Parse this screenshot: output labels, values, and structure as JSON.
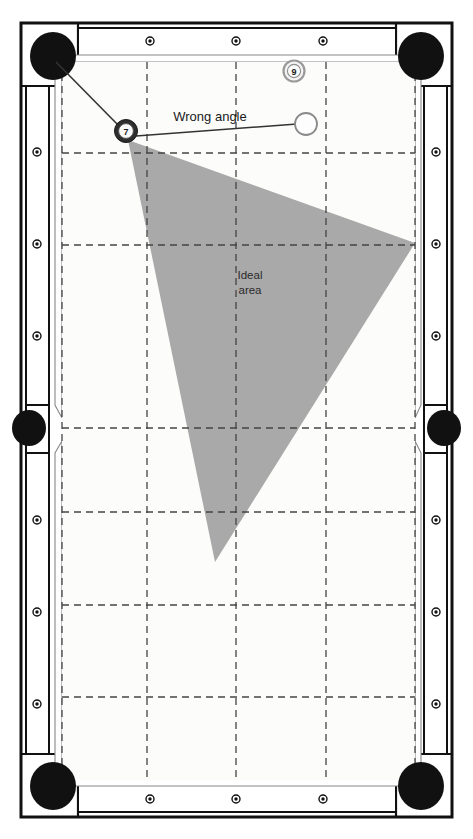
{
  "diagram": {
    "colors": {
      "cloth": "#fcfcfa",
      "rail": "#ffffff",
      "frame_stroke": "#111111",
      "pocket": "#111111",
      "grid_line": "#444444",
      "ideal_area_fill": "#a9a9a9",
      "aim_line": "#333333",
      "ball_outline": "#3a3a3a",
      "cue_ball_fill": "#fdfdfd",
      "object_ball_fill": "#f2f2f2"
    },
    "annotations": [
      {
        "id": "wrong-angle",
        "label": "Wrong angle",
        "x": 210,
        "y": 121
      },
      {
        "id": "ideal-area",
        "label_line1": "Ideal",
        "label_line2": "area",
        "x": 250,
        "y": 279
      }
    ],
    "balls": [
      {
        "id": "object-ball-9",
        "name": "nine-ball",
        "number": "9",
        "cx": 294,
        "cy": 71,
        "r": 10.5,
        "type": "numbered"
      },
      {
        "id": "object-ball-7",
        "name": "seven-ball",
        "number": "7",
        "cx": 126,
        "cy": 131,
        "r": 11.5,
        "type": "numbered"
      },
      {
        "id": "cue-ball",
        "name": "cue-ball",
        "number": "",
        "cx": 306,
        "cy": 124,
        "r": 11.0,
        "type": "cue"
      }
    ],
    "pockets": [
      {
        "id": "pocket-top-left",
        "name": "corner-pocket-top-left",
        "cx": 53,
        "cy": 56,
        "rx": 23,
        "ry": 24
      },
      {
        "id": "pocket-top-right",
        "name": "corner-pocket-top-right",
        "cx": 421,
        "cy": 56,
        "rx": 23,
        "ry": 24
      },
      {
        "id": "pocket-left-side",
        "name": "side-pocket-left",
        "cx": 29,
        "cy": 428,
        "rx": 17,
        "ry": 18
      },
      {
        "id": "pocket-right-side",
        "name": "side-pocket-right",
        "cx": 444,
        "cy": 428,
        "rx": 17,
        "ry": 18
      },
      {
        "id": "pocket-bottom-left",
        "name": "corner-pocket-bottom-left",
        "cx": 53,
        "cy": 786,
        "rx": 23,
        "ry": 24
      },
      {
        "id": "pocket-bottom-right",
        "name": "corner-pocket-bottom-right",
        "cx": 421,
        "cy": 786,
        "rx": 23,
        "ry": 24
      }
    ],
    "diamonds_top": [
      {
        "cx": 150,
        "cy": 38
      },
      {
        "cx": 236,
        "cy": 38
      },
      {
        "cx": 323,
        "cy": 38
      }
    ],
    "diamonds_bottom": [
      {
        "cx": 150,
        "cy": 803
      },
      {
        "cx": 236,
        "cy": 803
      },
      {
        "cx": 323,
        "cy": 803
      }
    ],
    "diamonds_left": [
      {
        "cx": 31,
        "cy": 152
      },
      {
        "cx": 31,
        "cy": 244
      },
      {
        "cx": 31,
        "cy": 336
      },
      {
        "cx": 31,
        "cy": 520
      },
      {
        "cx": 31,
        "cy": 612
      },
      {
        "cx": 31,
        "cy": 704
      }
    ],
    "diamonds_right": [
      {
        "cx": 442,
        "cy": 152
      },
      {
        "cx": 442,
        "cy": 244
      },
      {
        "cx": 442,
        "cy": 336
      },
      {
        "cx": 442,
        "cy": 520
      },
      {
        "cx": 442,
        "cy": 612
      },
      {
        "cx": 442,
        "cy": 704
      }
    ],
    "grid_vertical_x": [
      62,
      147,
      236,
      326,
      415
    ],
    "grid_horizontal_y": [
      153,
      245,
      428,
      512,
      605,
      697
    ],
    "ideal_area_polygon": "128,140 415,243 215,562",
    "aim_lines": [
      {
        "id": "aim-pocket-line",
        "name": "aim-line-to-pocket",
        "x1": 56,
        "y1": 60,
        "x2": 121,
        "y2": 127
      },
      {
        "id": "cue-to-object-line",
        "name": "cue-ball-path-line",
        "x1": 137,
        "y1": 135,
        "x2": 297,
        "y2": 124
      }
    ],
    "playfield": {
      "x": 62,
      "y": 62,
      "width": 353,
      "height": 718
    }
  }
}
